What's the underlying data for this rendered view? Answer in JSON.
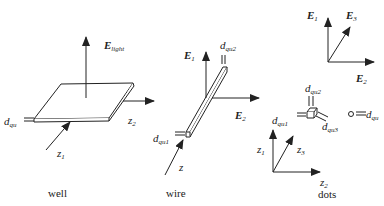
{
  "diagram": {
    "panels": [
      {
        "id": "well",
        "caption": "well",
        "labels": {
          "e_field": {
            "main": "E",
            "sub": "light"
          },
          "d_qu": {
            "main": "d",
            "sub": "qu"
          },
          "z1": {
            "main": "z",
            "sub": "1"
          },
          "z2": {
            "main": "z",
            "sub": "2"
          }
        }
      },
      {
        "id": "wire",
        "caption": "wire",
        "labels": {
          "e1": {
            "main": "E",
            "sub": "1"
          },
          "e2": {
            "main": "E",
            "sub": "2"
          },
          "d_qu1": {
            "main": "d",
            "sub": "qu1"
          },
          "d_qu2": {
            "main": "d",
            "sub": "qu2"
          },
          "z": {
            "main": "z"
          }
        }
      },
      {
        "id": "dots",
        "caption": "dots",
        "labels": {
          "e1": {
            "main": "E",
            "sub": "1"
          },
          "e2": {
            "main": "E",
            "sub": "2"
          },
          "e3": {
            "main": "E",
            "sub": "3"
          },
          "d_qu1": {
            "main": "d",
            "sub": "qu1"
          },
          "d_qu2": {
            "main": "d",
            "sub": "qu2"
          },
          "d_qu3": {
            "main": "d",
            "sub": "qu3"
          },
          "d_qu": {
            "main": "d",
            "sub": "qu"
          },
          "z1": {
            "main": "z",
            "sub": "1"
          },
          "z2": {
            "main": "z",
            "sub": "2"
          },
          "z3": {
            "main": "z",
            "sub": "3"
          }
        }
      }
    ],
    "colors": {
      "line": "#222222",
      "background": "#ffffff"
    }
  }
}
